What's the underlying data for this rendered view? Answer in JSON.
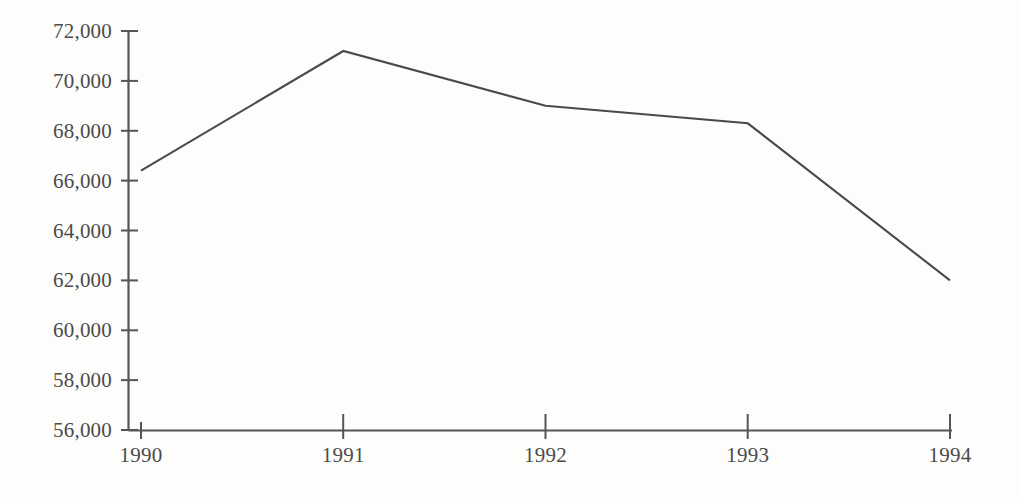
{
  "chart_data": {
    "type": "line",
    "title": "",
    "subtitle": "",
    "xlabel": "",
    "ylabel": "",
    "categories": [
      "1990",
      "1991",
      "1992",
      "1993",
      "1994"
    ],
    "x": [
      1990,
      1991,
      1992,
      1993,
      1994
    ],
    "values": [
      66400,
      71200,
      69000,
      68300,
      62000
    ],
    "series": [
      {
        "name": "",
        "values": [
          66400,
          71200,
          69000,
          68300,
          62000
        ]
      }
    ],
    "ylim": [
      56000,
      72000
    ],
    "xlim": [
      1990,
      1994
    ],
    "ytick_labels": [
      "72,000",
      "70,000",
      "68,000",
      "66,000",
      "64,000",
      "62,000",
      "60,000",
      "58,000",
      "56,000"
    ],
    "ytick_values": [
      72000,
      70000,
      68000,
      66000,
      64000,
      62000,
      60000,
      58000,
      56000
    ],
    "xtick_labels": [
      "1990",
      "1991",
      "1992",
      "1993",
      "1994"
    ],
    "grid": false,
    "legend": false,
    "legend_position": "none",
    "annotations": [],
    "line_color": "#4a4a4a",
    "axis_color": "#555555",
    "background_color": "#fdfdfc"
  },
  "axis": {
    "y_labels": {
      "t0": "72,000",
      "t1": "70,000",
      "t2": "68,000",
      "t3": "66,000",
      "t4": "64,000",
      "t5": "62,000",
      "t6": "60,000",
      "t7": "58,000",
      "t8": "56,000"
    },
    "x_labels": {
      "t0": "1990",
      "t1": "1991",
      "t2": "1992",
      "t3": "1993",
      "t4": "1994"
    }
  }
}
